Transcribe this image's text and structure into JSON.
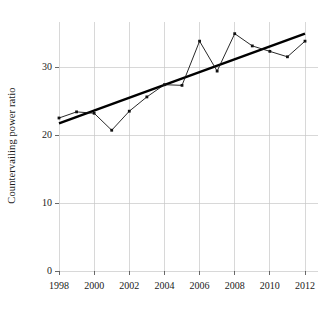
{
  "chart_data": {
    "type": "line",
    "title": "",
    "xlabel": "",
    "ylabel": "Countervailing power ratio",
    "xlim": [
      1997.4,
      2012.8
    ],
    "ylim": [
      0,
      36
    ],
    "grid": true,
    "legend": "none",
    "x": [
      1998,
      1999,
      2000,
      2001,
      2002,
      2003,
      2004,
      2005,
      2006,
      2007,
      2008,
      2009,
      2010,
      2011,
      2012
    ],
    "xticks": [
      1998,
      2000,
      2002,
      2004,
      2006,
      2008,
      2010,
      2012
    ],
    "xticklabels": [
      "1998",
      "2000",
      "2002",
      "2004",
      "2006",
      "2008",
      "2010",
      "2012"
    ],
    "yticks": [
      0,
      10,
      20,
      30
    ],
    "yticklabels": [
      "0",
      "10",
      "20",
      "30"
    ],
    "series": [
      {
        "name": "Countervailing power ratio",
        "style": "line-with-markers",
        "color": "#111111",
        "values": [
          22.5,
          23.4,
          23.2,
          20.7,
          23.5,
          25.6,
          27.4,
          27.3,
          33.8,
          29.4,
          34.9,
          33.1,
          32.3,
          31.5,
          33.8
        ]
      },
      {
        "name": "Linear trend",
        "style": "thick-straight-line",
        "color": "#000000",
        "endpoints": [
          {
            "x": 1998,
            "y": 21.7
          },
          {
            "x": 2012,
            "y": 34.9
          }
        ]
      }
    ]
  }
}
